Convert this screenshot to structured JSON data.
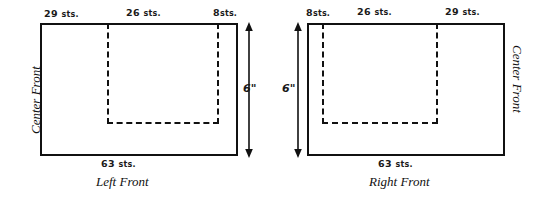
{
  "diagram": {
    "line_color": "#111111",
    "background_color": "#ffffff",
    "panels": [
      {
        "id": "left-front",
        "caption": "Left Front",
        "center_front_label": "Center Front",
        "center_front_side": "left",
        "top_labels": [
          "29 sts.",
          "26 sts.",
          "8sts."
        ],
        "top_label_numbers": [
          "29",
          "26",
          "8"
        ],
        "top_label_units": [
          "sts.",
          "sts.",
          "sts."
        ],
        "bottom_label": "63 sts.",
        "bottom_label_number": "63",
        "bottom_label_unit": "sts.",
        "height_label": "6\"",
        "height_value": 6,
        "height_unit": "inches",
        "arrow_side": "right"
      },
      {
        "id": "right-front",
        "caption": "Right Front",
        "center_front_label": "Center Front",
        "center_front_side": "right",
        "top_labels": [
          "8sts.",
          "26 sts.",
          "29 sts."
        ],
        "top_label_numbers": [
          "8",
          "26",
          "29"
        ],
        "top_label_units": [
          "sts.",
          "sts.",
          "sts."
        ],
        "bottom_label": "63 sts.",
        "bottom_label_number": "63",
        "bottom_label_unit": "sts.",
        "height_label": "6\"",
        "height_value": 6,
        "height_unit": "inches",
        "arrow_side": "left"
      }
    ]
  }
}
